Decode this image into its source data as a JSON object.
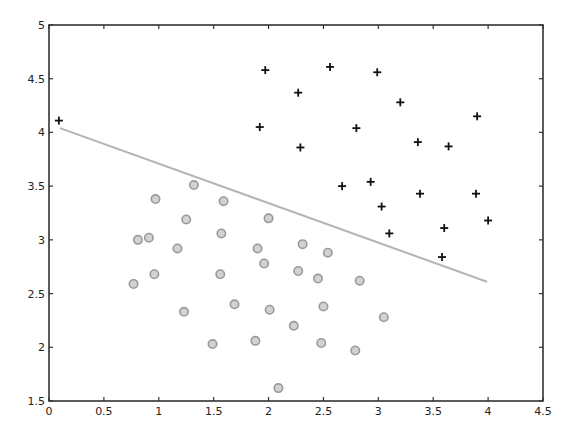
{
  "chart_data": {
    "type": "scatter",
    "title": "",
    "xlabel": "",
    "ylabel": "",
    "xlim": [
      0,
      4.5
    ],
    "ylim": [
      1.5,
      5
    ],
    "grid": false,
    "legend": null,
    "xticks": [
      "0",
      "0.5",
      "1",
      "1.5",
      "2",
      "2.5",
      "3",
      "3.5",
      "4",
      "4.5"
    ],
    "yticks": [
      "1.5",
      "2",
      "2.5",
      "3",
      "3.5",
      "4",
      "4.5",
      "5"
    ],
    "series": [
      {
        "name": "positive class",
        "marker": "plus",
        "color": "#111111",
        "points": [
          [
            0.09,
            4.11
          ],
          [
            1.97,
            4.58
          ],
          [
            2.27,
            4.37
          ],
          [
            2.56,
            4.61
          ],
          [
            2.99,
            4.56
          ],
          [
            3.2,
            4.28
          ],
          [
            1.92,
            4.05
          ],
          [
            2.29,
            3.86
          ],
          [
            2.8,
            4.04
          ],
          [
            3.36,
            3.91
          ],
          [
            3.9,
            4.15
          ],
          [
            3.64,
            3.87
          ],
          [
            2.67,
            3.5
          ],
          [
            2.93,
            3.54
          ],
          [
            3.38,
            3.43
          ],
          [
            3.89,
            3.43
          ],
          [
            3.03,
            3.31
          ],
          [
            3.1,
            3.06
          ],
          [
            3.6,
            3.11
          ],
          [
            4.0,
            3.18
          ],
          [
            3.58,
            2.84
          ]
        ]
      },
      {
        "name": "negative class",
        "marker": "circle",
        "color": "#9a9a9a",
        "fill": "#cfcfcf",
        "points": [
          [
            1.32,
            3.51
          ],
          [
            0.97,
            3.38
          ],
          [
            1.59,
            3.36
          ],
          [
            1.25,
            3.19
          ],
          [
            2.0,
            3.2
          ],
          [
            0.81,
            3.0
          ],
          [
            0.91,
            3.02
          ],
          [
            1.57,
            3.06
          ],
          [
            1.17,
            2.92
          ],
          [
            1.9,
            2.92
          ],
          [
            2.31,
            2.96
          ],
          [
            1.96,
            2.78
          ],
          [
            2.54,
            2.88
          ],
          [
            0.77,
            2.59
          ],
          [
            0.96,
            2.68
          ],
          [
            1.56,
            2.68
          ],
          [
            2.27,
            2.71
          ],
          [
            2.45,
            2.64
          ],
          [
            2.83,
            2.62
          ],
          [
            1.69,
            2.4
          ],
          [
            1.23,
            2.33
          ],
          [
            2.01,
            2.35
          ],
          [
            2.5,
            2.38
          ],
          [
            2.23,
            2.2
          ],
          [
            3.05,
            2.28
          ],
          [
            1.88,
            2.06
          ],
          [
            1.49,
            2.03
          ],
          [
            2.48,
            2.04
          ],
          [
            2.79,
            1.97
          ],
          [
            2.09,
            1.62
          ]
        ]
      },
      {
        "name": "decision boundary",
        "type": "line",
        "color": "#b4b4b4",
        "points": [
          [
            0.1,
            4.04
          ],
          [
            3.99,
            2.61
          ]
        ]
      }
    ]
  },
  "colors": {
    "axis": "#333333",
    "plus": "#111111",
    "circle_stroke": "#9a9a9a",
    "circle_fill": "#d2d2d2",
    "line": "#b4b4b4"
  }
}
